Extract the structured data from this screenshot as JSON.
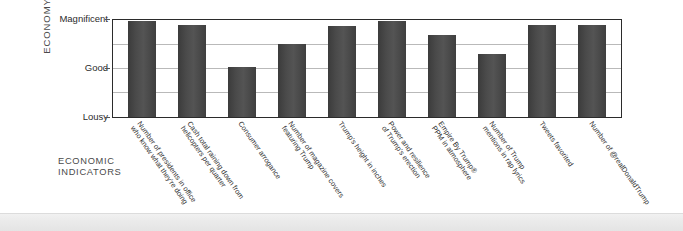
{
  "chart_data": {
    "type": "bar",
    "title": "",
    "xlabel": "ECONOMIC INDICATORS",
    "ylabel": "ECONOMY",
    "ylim": [
      0,
      4
    ],
    "grid": true,
    "legend": "none",
    "ytick_labels": [
      "Magnificent",
      "Good",
      "Lousy"
    ],
    "ytick_values": [
      4,
      2,
      0
    ],
    "gridline_values": [
      4,
      3,
      2,
      1,
      0
    ],
    "categories": [
      "Number of presidents in office who know what they're doing",
      "Cash total raining down from helicopters per quarter",
      "Consumer arrogance",
      "Number of magazine covers featuring Trump",
      "Trump's height in inches",
      "Power and resilience of Trump's erection",
      "Empire By Trump® PPM in atmosphere",
      "Number of Trump mentions in rap lyrics",
      "Tweets favorited",
      "Number of @realDonaldTrump Tweets favorited"
    ],
    "category_lines": [
      [
        "Number of presidents in office",
        "who know what they're doing"
      ],
      [
        "Cash total raining down from",
        "helicopters per quarter"
      ],
      [
        "Consumer arrogance",
        ""
      ],
      [
        "Number of magazine covers",
        "featuring Trump"
      ],
      [
        "Trump's height in inches",
        ""
      ],
      [
        "Power and resilience",
        "of Trump's erection"
      ],
      [
        "Empire By Trump®",
        "PPM in atmosphere"
      ],
      [
        "Number of Trump",
        "mentions in rap lyrics"
      ],
      [
        "Tweets favorited",
        ""
      ],
      [
        "Number of @realDonaldTrump",
        ""
      ]
    ],
    "values": [
      3.95,
      3.78,
      2.05,
      3.0,
      3.75,
      3.95,
      3.4,
      2.6,
      3.78,
      3.78
    ],
    "bar_color": "#454545",
    "axis_color": "#2b2b2b",
    "grid_color": "#b9b9b9"
  }
}
